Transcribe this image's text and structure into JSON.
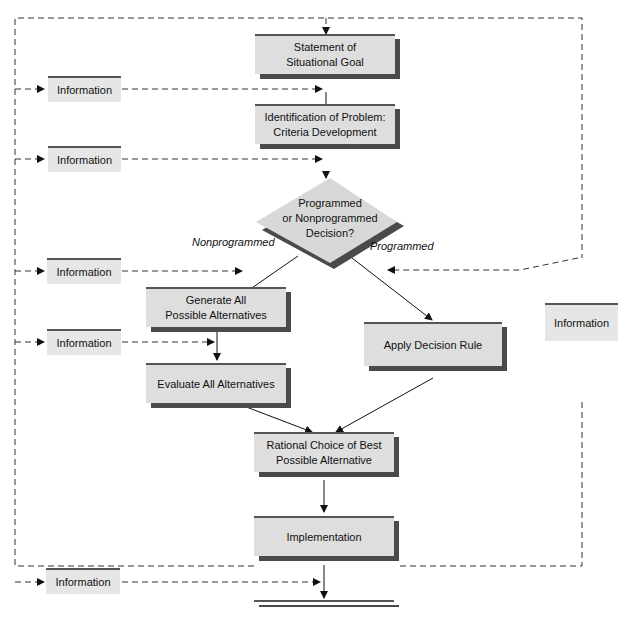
{
  "diagram": {
    "nodes": {
      "goal": "Statement of\nSituational Goal",
      "problem": "Identification of Problem:\nCriteria Development",
      "decision": "Programmed\nor Nonprogrammed\nDecision?",
      "generate": "Generate All\nPossible Alternatives",
      "evaluate": "Evaluate All Alternatives",
      "rule": "Apply Decision Rule",
      "choice": "Rational Choice of Best\nPossible Alternative",
      "implementation": "Implementation",
      "control": "Control:\nMeasurement and\nAdjustment"
    },
    "info_boxes": [
      "Information",
      "Information",
      "Information",
      "Information",
      "Information",
      "Information"
    ],
    "edge_labels": {
      "nonprogrammed": "Nonprogrammed",
      "programmed": "Programmed"
    },
    "colors": {
      "box_fill": "#dedede",
      "shadow": "#4a4a4a",
      "line": "#222222"
    }
  }
}
